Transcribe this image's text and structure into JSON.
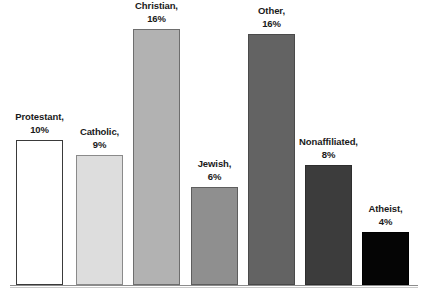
{
  "chart_data": {
    "type": "bar",
    "title": "",
    "subtitle": "",
    "xlabel": "",
    "ylabel": "",
    "categories": [
      "Protestant",
      "Catholic",
      "Christian",
      "Jewish",
      "Other",
      "Nonaffiliated",
      "Atheist"
    ],
    "values": [
      10,
      9,
      16,
      6,
      16,
      8,
      4
    ],
    "value_suffix": "%",
    "ylim": [
      0,
      17
    ],
    "grid": false,
    "legend": null,
    "axis_visible": {
      "x": true,
      "y": false
    },
    "data_labels_position": "above-bar",
    "bars": [
      {
        "category": "Protestant",
        "value": 10,
        "label_name": "Protestant,",
        "label_value": "10%",
        "fill": "#ffffff",
        "stroke": "#3a3a3a",
        "x": 16,
        "width": 47,
        "top": 140,
        "height": 145
      },
      {
        "category": "Catholic",
        "value": 9,
        "label_name": "Catholic,",
        "label_value": "9%",
        "fill": "#dddddd",
        "stroke": "#8a8a8a",
        "x": 76,
        "width": 47,
        "top": 155,
        "height": 130
      },
      {
        "category": "Christian",
        "value": 16,
        "label_name": "Christian,",
        "label_value": "16%",
        "fill": "#b2b2b2",
        "stroke": "#6e6e6e",
        "x": 133,
        "width": 47,
        "top": 29,
        "height": 256
      },
      {
        "category": "Jewish",
        "value": 6,
        "label_name": "Jewish,",
        "label_value": "6%",
        "fill": "#8f8f8f",
        "stroke": "#5e5e5e",
        "x": 191,
        "width": 47,
        "top": 187,
        "height": 98
      },
      {
        "category": "Other",
        "value": 16,
        "label_name": "Other,",
        "label_value": "16%",
        "fill": "#636363",
        "stroke": "#4a4a4a",
        "x": 248,
        "width": 47,
        "top": 34,
        "height": 251
      },
      {
        "category": "Nonaffiliated",
        "value": 8,
        "label_name": "Nonaffiliated,",
        "label_value": "8%",
        "fill": "#3c3c3c",
        "stroke": "#2e2e2e",
        "x": 305,
        "width": 47,
        "top": 165,
        "height": 120
      },
      {
        "category": "Atheist",
        "value": 4,
        "label_name": "Atheist,",
        "label_value": "4%",
        "fill": "#050505",
        "stroke": "#000000",
        "x": 362,
        "width": 47,
        "top": 232,
        "height": 53
      }
    ],
    "colors": {
      "background": "#ffffff",
      "axis": "#8c8c8c",
      "text": "#1a1a1a"
    }
  }
}
